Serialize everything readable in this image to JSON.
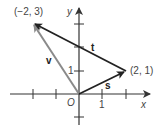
{
  "diagram": {
    "type": "vector-diagram",
    "axes": {
      "x_label": "x",
      "y_label": "y",
      "origin_label": "O",
      "x_tick_label": "1",
      "y_tick_label": "1",
      "x_range": [
        -2,
        2
      ],
      "y_range": [
        -1,
        3
      ]
    },
    "points": [
      {
        "name": "P",
        "coords": [
          -2,
          3
        ],
        "label": "(−2, 3)"
      },
      {
        "name": "Q",
        "coords": [
          2,
          1
        ],
        "label": "(2, 1)"
      }
    ],
    "vectors": [
      {
        "name": "v",
        "label": "v",
        "from": [
          0,
          0
        ],
        "to": [
          -2,
          3
        ],
        "color": "#8a8a8a"
      },
      {
        "name": "s",
        "label": "s",
        "from": [
          0,
          0
        ],
        "to": [
          2,
          1
        ],
        "color": "#222222"
      },
      {
        "name": "t",
        "label": "t",
        "from": [
          2,
          1
        ],
        "to": [
          -2,
          3
        ],
        "color": "#222222"
      }
    ]
  }
}
